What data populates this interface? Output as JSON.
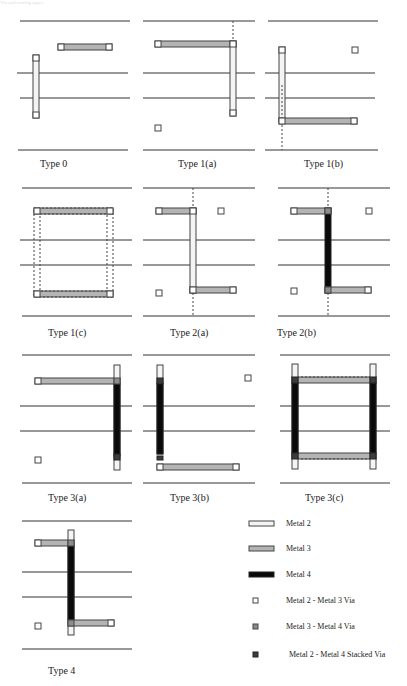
{
  "header": {
    "text": "Via and routing types"
  },
  "colors": {
    "metal2": "#f4f4f4",
    "metal3": "#b4b4b4",
    "metal4": "#0a0a0a",
    "via23": "#ffffff",
    "via34": "#8c8c8c",
    "stacked": "#3c3c3c",
    "stroke": "#444444",
    "track": "#333333"
  },
  "panels": [
    {
      "id": "type-0",
      "label": "Type  0",
      "x": 0,
      "y": 0,
      "label_x": 40,
      "label_y": 165
    },
    {
      "id": "type-1a",
      "label": "Type  1(a)",
      "x": 135,
      "y": 0,
      "label_x": 178,
      "label_y": 165
    },
    {
      "id": "type-1b",
      "label": "Type  1(b)",
      "x": 270,
      "y": 0,
      "label_x": 304,
      "label_y": 165
    },
    {
      "id": "type-1c",
      "label": "Type  1(c)",
      "x": 0,
      "y": 172,
      "label_x": 48,
      "label_y": 334
    },
    {
      "id": "type-2a",
      "label": "Type  2(a)",
      "x": 135,
      "y": 172,
      "label_x": 170,
      "label_y": 334
    },
    {
      "id": "type-2b",
      "label": "Type  2(b)",
      "x": 270,
      "y": 172,
      "label_x": 277,
      "label_y": 334
    },
    {
      "id": "type-3a",
      "label": "Type  3(a)",
      "x": 0,
      "y": 344,
      "label_x": 48,
      "label_y": 497
    },
    {
      "id": "type-3b",
      "label": "Type  3(b)",
      "x": 135,
      "y": 344,
      "label_x": 170,
      "label_y": 497
    },
    {
      "id": "type-3c",
      "label": "Type  3(c)",
      "x": 270,
      "y": 344,
      "label_x": 305,
      "label_y": 497
    },
    {
      "id": "type-4",
      "label": "Type  4",
      "x": 0,
      "y": 517,
      "label_x": 48,
      "label_y": 669
    }
  ],
  "legend": {
    "items": [
      {
        "id": "metal2",
        "label": "Metal  2",
        "kind": "bar",
        "y": 524
      },
      {
        "id": "metal3",
        "label": "Metal  3",
        "kind": "bar",
        "y": 549
      },
      {
        "id": "metal4",
        "label": "Metal  4",
        "kind": "bar",
        "y": 575
      },
      {
        "id": "via23",
        "label": "Metal  2 - Metal  3  Via",
        "kind": "square",
        "y": 602
      },
      {
        "id": "via34",
        "label": "Metal  3 - Metal  4  Via",
        "kind": "square",
        "y": 628
      },
      {
        "id": "stacked",
        "label": "Metal  2 - Metal  4 Stacked Via",
        "kind": "square",
        "y": 655
      }
    ]
  }
}
